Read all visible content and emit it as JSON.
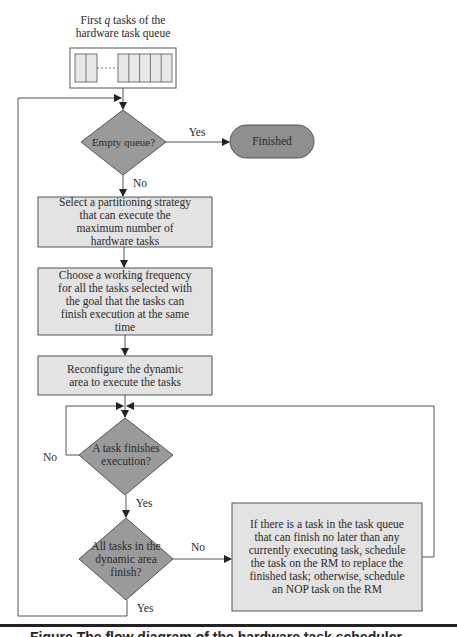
{
  "diagram": {
    "type": "flowchart",
    "colors": {
      "process_fill": "#e3e3e3",
      "decision_fill": "#9a9a9a",
      "terminal_fill": "#8f8f8f",
      "stroke": "#555555",
      "rule": "#222222"
    },
    "queue": {
      "title_line1": "First q tasks of the",
      "title_line2": "hardware task queue",
      "left_cells": 2,
      "right_cells": 5
    },
    "nodes": {
      "empty_queue": "Empty queue?",
      "finished": "Finished",
      "select_strategy": "Select a partitioning strategy that can execute the maximum number of hardware tasks",
      "choose_frequency": "Choose a working frequency for all the tasks selected with the goal that the tasks can finish execution at the same time",
      "reconfigure": "Reconfigure the dynamic area to execute the tasks",
      "task_finishes": "A task finishes execution?",
      "all_finish": "All tasks in the dynamic area finish?",
      "schedule_replace": "If there is a task in the task queue that can finish no later than any currently executing task, schedule the task on the RM to replace the finished task; otherwise, schedule an NOP task on the RM"
    },
    "edge_labels": {
      "empty_yes": "Yes",
      "empty_no": "No",
      "task_no": "No",
      "task_yes": "Yes",
      "all_no": "No",
      "all_yes": "Yes"
    },
    "edges": [
      {
        "from": "queue",
        "to": "empty_queue"
      },
      {
        "from": "empty_queue",
        "to": "finished",
        "label": "Yes"
      },
      {
        "from": "empty_queue",
        "to": "select_strategy",
        "label": "No"
      },
      {
        "from": "select_strategy",
        "to": "choose_frequency"
      },
      {
        "from": "choose_frequency",
        "to": "reconfigure"
      },
      {
        "from": "reconfigure",
        "to": "task_finishes"
      },
      {
        "from": "task_finishes",
        "to": "task_finishes",
        "label": "No"
      },
      {
        "from": "task_finishes",
        "to": "all_finish",
        "label": "Yes"
      },
      {
        "from": "all_finish",
        "to": "schedule_replace",
        "label": "No"
      },
      {
        "from": "schedule_replace",
        "to": "task_finishes"
      },
      {
        "from": "all_finish",
        "to": "empty_queue",
        "label": "Yes"
      }
    ]
  },
  "caption": "Figure  The flow diagram of the hardware task scheduler"
}
